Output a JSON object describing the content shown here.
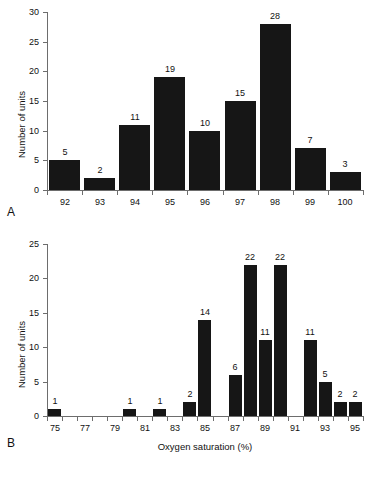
{
  "figure": {
    "background_color": "#ffffff",
    "bar_color": "#161616",
    "axis_color": "#6d6d6d",
    "text_color": "#111111"
  },
  "panel_a": {
    "letter": "A",
    "ylabel": "Number of units",
    "xlabel": "",
    "y_ticks": [
      "0",
      "5",
      "10",
      "15",
      "20",
      "25",
      "30"
    ],
    "x_ticks": [
      "92",
      "93",
      "94",
      "95",
      "96",
      "97",
      "98",
      "99",
      "100"
    ],
    "bar_labels": [
      "5",
      "2",
      "11",
      "19",
      "10",
      "15",
      "28",
      "7",
      "3"
    ]
  },
  "panel_b": {
    "letter": "B",
    "ylabel": "Number of units",
    "xlabel": "Oxygen saturation (%)",
    "y_ticks": [
      "0",
      "5",
      "10",
      "15",
      "20",
      "25"
    ],
    "x_ticks": [
      "75",
      "77",
      "79",
      "81",
      "83",
      "85",
      "87",
      "89",
      "91",
      "93",
      "95"
    ],
    "bar_labels": [
      "1",
      "1",
      "1",
      "2",
      "14",
      "6",
      "22",
      "11",
      "22",
      "11",
      "5",
      "2",
      "2"
    ]
  },
  "chart_data": [
    {
      "type": "bar",
      "panel": "A",
      "title": "",
      "xlabel": "",
      "ylabel": "Number of units",
      "categories": [
        "92",
        "93",
        "94",
        "95",
        "96",
        "97",
        "98",
        "99",
        "100"
      ],
      "values": [
        5,
        2,
        11,
        19,
        10,
        15,
        28,
        7,
        3
      ],
      "data_labels": [
        "5",
        "2",
        "11",
        "19",
        "10",
        "15",
        "28",
        "7",
        "3"
      ],
      "xlim": [
        91.5,
        100.5
      ],
      "ylim": [
        0,
        30
      ],
      "y_ticks": [
        0,
        5,
        10,
        15,
        20,
        25,
        30
      ],
      "x_tick_labels": [
        "92",
        "93",
        "94",
        "95",
        "96",
        "97",
        "98",
        "99",
        "100"
      ],
      "grid": false,
      "legend": false,
      "bar_color": "#161616"
    },
    {
      "type": "bar",
      "panel": "B",
      "title": "",
      "xlabel": "Oxygen saturation (%)",
      "ylabel": "Number of units",
      "categories": [
        "75",
        "76",
        "77",
        "78",
        "79",
        "80",
        "81",
        "82",
        "83",
        "84",
        "85",
        "86",
        "87",
        "88",
        "89",
        "90",
        "91",
        "92",
        "93",
        "94",
        "95"
      ],
      "values": [
        1,
        0,
        0,
        0,
        0,
        1,
        0,
        1,
        0,
        2,
        14,
        0,
        6,
        22,
        11,
        22,
        0,
        11,
        5,
        2,
        2
      ],
      "data_labels": [
        "1",
        "",
        "",
        "",
        "",
        "1",
        "",
        "1",
        "",
        "2",
        "14",
        "",
        "6",
        "22",
        "11",
        "22",
        "",
        "11",
        "5",
        "2",
        "2"
      ],
      "xlim": [
        75,
        96
      ],
      "ylim": [
        0,
        25
      ],
      "y_ticks": [
        0,
        5,
        10,
        15,
        20,
        25
      ],
      "x_tick_labels": [
        "75",
        "77",
        "79",
        "81",
        "83",
        "85",
        "87",
        "89",
        "91",
        "93",
        "95"
      ],
      "x_tick_values": [
        75,
        77,
        79,
        81,
        83,
        85,
        87,
        89,
        91,
        93,
        95
      ],
      "grid": false,
      "legend": false,
      "bar_color": "#161616"
    }
  ]
}
